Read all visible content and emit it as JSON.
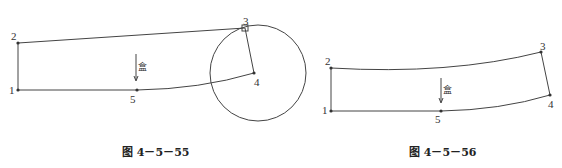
{
  "figures": [
    {
      "caption": "图 4－5－55",
      "points": [
        {
          "label": "1",
          "x": 18,
          "y": 90
        },
        {
          "label": "2",
          "x": 18,
          "y": 43
        },
        {
          "label": "3",
          "x": 245,
          "y": 28
        },
        {
          "label": "4",
          "x": 254,
          "y": 73
        },
        {
          "label": "5",
          "x": 137,
          "y": 90
        }
      ],
      "circle": {
        "cx": 258,
        "cy": 73,
        "r": 48
      },
      "grain_glyph": "盒"
    },
    {
      "caption": "图 4－5－56",
      "points": [
        {
          "label": "1",
          "x": 331,
          "y": 111
        },
        {
          "label": "2",
          "x": 331,
          "y": 68
        },
        {
          "label": "3",
          "x": 541,
          "y": 52
        },
        {
          "label": "4",
          "x": 550,
          "y": 95
        },
        {
          "label": "5",
          "x": 441,
          "y": 111
        }
      ],
      "grain_glyph": "盒"
    }
  ],
  "colors": {
    "line": "#444444",
    "text": "#222222"
  }
}
